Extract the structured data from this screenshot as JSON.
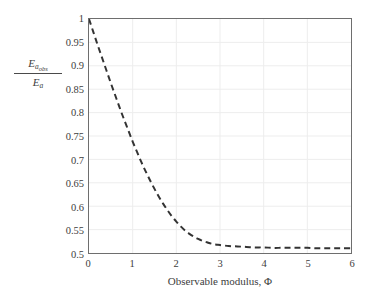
{
  "chart_data": {
    "type": "line",
    "title": "",
    "subtitle": "",
    "xlabel": "Observable modulus, Φ",
    "ylabel_numerator": "E",
    "ylabel_numerator_sub": "a",
    "ylabel_numerator_subsub": "obs",
    "ylabel_denominator": "E",
    "ylabel_denominator_sub": "a",
    "ylabel_plain": "E_a_obs / E_a",
    "xlim": [
      0,
      6
    ],
    "ylim": [
      0.5,
      1.0
    ],
    "xticks": [
      "0",
      "1",
      "2",
      "3",
      "4",
      "5",
      "6"
    ],
    "xtick_values": [
      0,
      1,
      2,
      3,
      4,
      5,
      6
    ],
    "yticks": [
      "0.5",
      "0.55",
      "0.6",
      "0.65",
      "0.7",
      "0.75",
      "0.8",
      "0.85",
      "0.9",
      "0.95",
      "1"
    ],
    "ytick_values": [
      0.5,
      0.55,
      0.6,
      0.65,
      0.7,
      0.75,
      0.8,
      0.85,
      0.9,
      0.95,
      1.0
    ],
    "grid": true,
    "grid_color": "#ededed",
    "legend": null,
    "legend_position": "none",
    "line_color": "#333333",
    "line_style": "dashed",
    "line_width": 2,
    "axis_color": "#6e6e6e",
    "background_color": "#ffffff",
    "asymptote": 0.51,
    "series": [
      {
        "name": "Eaobs/Ea",
        "x": [
          0.0,
          0.1,
          0.2,
          0.3,
          0.4,
          0.5,
          0.6,
          0.7,
          0.8,
          0.9,
          1.0,
          1.1,
          1.2,
          1.3,
          1.4,
          1.5,
          1.6,
          1.7,
          1.8,
          1.9,
          2.0,
          2.1,
          2.2,
          2.3,
          2.4,
          2.5,
          2.6,
          2.7,
          2.8,
          2.9,
          3.0,
          3.2,
          3.4,
          3.6,
          3.8,
          4.0,
          4.2,
          4.4,
          4.6,
          4.8,
          5.0,
          5.2,
          5.4,
          5.6,
          5.8,
          6.0
        ],
        "y": [
          1.0,
          0.972,
          0.944,
          0.917,
          0.89,
          0.863,
          0.837,
          0.811,
          0.786,
          0.762,
          0.738,
          0.716,
          0.694,
          0.674,
          0.655,
          0.637,
          0.62,
          0.605,
          0.591,
          0.578,
          0.567,
          0.557,
          0.548,
          0.541,
          0.535,
          0.53,
          0.526,
          0.523,
          0.52,
          0.518,
          0.517,
          0.515,
          0.514,
          0.513,
          0.512,
          0.512,
          0.511,
          0.511,
          0.511,
          0.511,
          0.511,
          0.51,
          0.51,
          0.51,
          0.51,
          0.51
        ]
      }
    ]
  },
  "figure": {
    "axis_label_x": "Observable modulus, Φ"
  }
}
